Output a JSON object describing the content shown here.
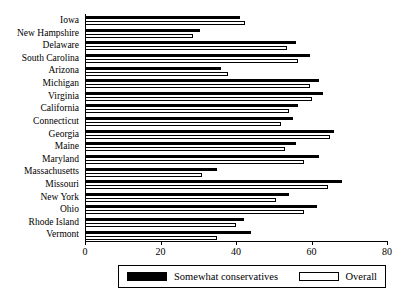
{
  "chart_data": {
    "type": "bar",
    "orientation": "horizontal",
    "title": "",
    "xlabel": "",
    "ylabel": "",
    "xlim": [
      0,
      80
    ],
    "xticks": [
      0,
      20,
      40,
      60,
      80
    ],
    "grid": false,
    "legend_position": "bottom",
    "categories": [
      "Iowa",
      "New Hampshire",
      "Delaware",
      "South Carolina",
      "Arizona",
      "Michigan",
      "Virginia",
      "California",
      "Connecticut",
      "Georgia",
      "Maine",
      "Maryland",
      "Massachusetts",
      "Missouri",
      "New York",
      "Ohio",
      "Rhode Island",
      "Vermont"
    ],
    "series": [
      {
        "name": "Somewhat conservatives",
        "color": "#000000",
        "values": [
          41,
          30.5,
          56,
          59.5,
          36,
          62,
          63,
          56.5,
          55,
          66,
          56,
          62,
          35,
          68,
          54,
          61.5,
          42,
          44
        ]
      },
      {
        "name": "Overall",
        "color": "#ffffff",
        "values": [
          42.5,
          28.5,
          53.5,
          56.5,
          38,
          59.5,
          60,
          54,
          52,
          65,
          53,
          58,
          31,
          64.5,
          50.5,
          58,
          40,
          35
        ]
      }
    ]
  },
  "legend": {
    "items": [
      {
        "label": "Somewhat conservatives",
        "swatch": "black-swatch"
      },
      {
        "label": "Overall",
        "swatch": "white-swatch"
      }
    ]
  },
  "axis": {
    "tick_labels": [
      "0",
      "20",
      "40",
      "60",
      "80"
    ]
  }
}
